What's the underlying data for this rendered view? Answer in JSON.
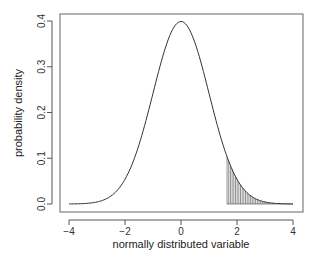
{
  "chart_data": {
    "type": "line",
    "title": "",
    "xlabel": "normally distributed variable",
    "ylabel": "probability density",
    "xlim": [
      -4,
      4
    ],
    "ylim": [
      0,
      0.4
    ],
    "x_ticks": [
      "-4",
      "-2",
      "0",
      "2",
      "4"
    ],
    "y_ticks": [
      "0.0",
      "0.1",
      "0.2",
      "0.3",
      "0.4"
    ],
    "grid": false,
    "legend": null,
    "series": [
      {
        "name": "standard normal density",
        "x": [
          -4,
          -3.5,
          -3,
          -2.5,
          -2,
          -1.5,
          -1,
          -0.5,
          0,
          0.5,
          1,
          1.5,
          2,
          2.5,
          3,
          3.5,
          4
        ],
        "values": [
          0.0001,
          0.0009,
          0.0044,
          0.0175,
          0.054,
          0.1295,
          0.242,
          0.3521,
          0.3989,
          0.3521,
          0.242,
          0.1295,
          0.054,
          0.0175,
          0.0044,
          0.0009,
          0.0001
        ]
      }
    ],
    "shaded_region": {
      "from": 1.645,
      "to": 4,
      "style": "vertical hatch lines",
      "description": "upper tail area"
    }
  },
  "colors": {
    "line": "#333333",
    "axis": "#555555",
    "background": "#ffffff"
  }
}
